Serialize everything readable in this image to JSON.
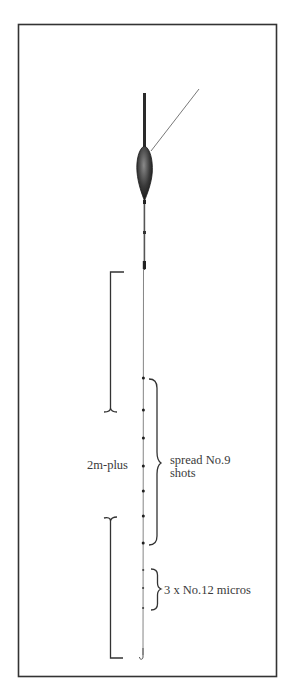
{
  "diagram": {
    "type": "fishing-float-rig",
    "labels": {
      "length": "2m-plus",
      "spread_line1": "spread No.9",
      "spread_line2": "shots",
      "micros": "3 x No.12 micros"
    },
    "components": [
      {
        "name": "float",
        "description": "antenna float with bulbous body"
      },
      {
        "name": "main-line",
        "description": "line running to rod"
      },
      {
        "name": "stem",
        "description": "float stem with bands"
      },
      {
        "name": "hook-length",
        "description": "line down to hook"
      },
      {
        "name": "no9-shots",
        "count": 7
      },
      {
        "name": "no12-micros",
        "count": 3
      },
      {
        "name": "hook"
      }
    ],
    "colors": {
      "ink": "#2e2e2e",
      "frame": "#333333",
      "text": "#3a3a3a",
      "background": "#ffffff"
    }
  }
}
